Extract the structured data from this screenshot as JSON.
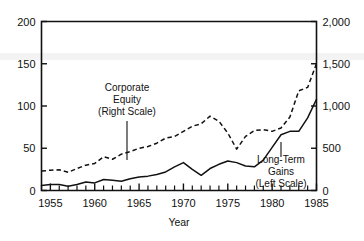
{
  "chart_data": {
    "type": "line",
    "title": "",
    "xlabel": "Year",
    "ylabel": "",
    "xlim": [
      1954,
      1985
    ],
    "xticks_labeled": [
      "1955",
      "1960",
      "1965",
      "1970",
      "1975",
      "1980",
      "1985"
    ],
    "grid": false,
    "legend_position": "inline-annotations",
    "left_axis": {
      "label": "",
      "lim": [
        0,
        200
      ],
      "ticks": [
        0,
        50,
        100,
        150,
        200
      ],
      "ticklabels": [
        "0",
        "50",
        "100",
        "150",
        "200"
      ],
      "series": "Long-Term Gains"
    },
    "right_axis": {
      "label": "",
      "lim": [
        0,
        2000
      ],
      "ticks": [
        0,
        500,
        1000,
        1500,
        2000
      ],
      "ticklabels": [
        "0",
        "500",
        "1,000",
        "1,500",
        "2,000"
      ],
      "series": "Corporate Equity"
    },
    "x": [
      1954,
      1955,
      1956,
      1957,
      1958,
      1959,
      1960,
      1961,
      1962,
      1963,
      1964,
      1965,
      1966,
      1967,
      1968,
      1969,
      1970,
      1971,
      1972,
      1973,
      1974,
      1975,
      1976,
      1977,
      1978,
      1979,
      1980,
      1981,
      1982,
      1983,
      1984,
      1985
    ],
    "series": [
      {
        "name": "Long-Term Gains (Left Scale)",
        "axis": "left",
        "style": "solid",
        "units": "billions of dollars",
        "values": [
          6,
          7,
          7,
          5,
          7,
          10,
          9,
          13,
          12,
          11,
          14,
          16,
          17,
          19,
          22,
          28,
          33,
          25,
          18,
          26,
          31,
          35,
          33,
          29,
          28,
          36,
          51,
          66,
          70,
          70,
          86,
          108
        ]
      },
      {
        "name": "Corporate Equity (Right Scale)",
        "axis": "right",
        "style": "dashed",
        "units": "billions of dollars",
        "values": [
          230,
          240,
          245,
          215,
          260,
          300,
          320,
          400,
          370,
          430,
          460,
          500,
          520,
          560,
          620,
          640,
          700,
          760,
          790,
          880,
          820,
          680,
          490,
          640,
          710,
          720,
          700,
          740,
          870,
          1180,
          1220,
          1500
        ]
      }
    ],
    "annotations": [
      {
        "name": "corporate-equity",
        "lines": [
          "Corporate",
          "Equity",
          "(Right Scale)"
        ],
        "leader": true
      },
      {
        "name": "long-term-gains",
        "lines": [
          "Long-Term",
          "Gains",
          "(Left Scale)"
        ],
        "leader": true
      }
    ]
  }
}
